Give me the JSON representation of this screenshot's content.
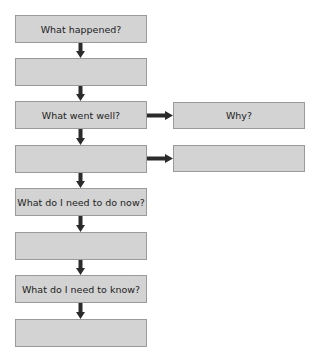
{
  "flowchart": {
    "left_boxes": [
      {
        "label": "What happened?"
      },
      {
        "label": ""
      },
      {
        "label": "What went well?"
      },
      {
        "label": ""
      },
      {
        "label": "What do I need to do now?"
      },
      {
        "label": ""
      },
      {
        "label": "What do I need to know?"
      },
      {
        "label": ""
      }
    ],
    "right_boxes": [
      {
        "label": "Why?"
      },
      {
        "label": ""
      }
    ]
  },
  "colors": {
    "box_fill": "#d3d3d3",
    "box_border": "#9a9a9a",
    "arrow": "#2b2b2b",
    "text": "#222222"
  }
}
